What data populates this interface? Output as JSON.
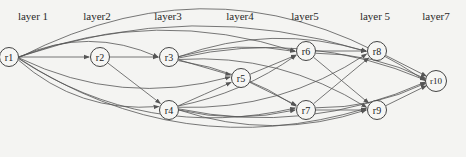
{
  "diagram": {
    "type": "layered directed graph",
    "layers": [
      {
        "label": "layer 1",
        "x": 33
      },
      {
        "label": "layer2",
        "x": 97
      },
      {
        "label": "layer3",
        "x": 168
      },
      {
        "label": "layer4",
        "x": 240
      },
      {
        "label": "layer5",
        "x": 305
      },
      {
        "label": "layer 5",
        "x": 375
      },
      {
        "label": "layer7",
        "x": 436
      }
    ],
    "nodes": [
      {
        "id": "r1",
        "label": "r1",
        "x": 9,
        "y": 57
      },
      {
        "id": "r2",
        "label": "r2",
        "x": 100,
        "y": 57
      },
      {
        "id": "r3",
        "label": "r3",
        "x": 169,
        "y": 57
      },
      {
        "id": "r4",
        "label": "r4",
        "x": 169,
        "y": 110
      },
      {
        "id": "r5",
        "label": "r5",
        "x": 241,
        "y": 78
      },
      {
        "id": "r6",
        "label": "r6",
        "x": 306,
        "y": 51
      },
      {
        "id": "r7",
        "label": "r7",
        "x": 306,
        "y": 110
      },
      {
        "id": "r8",
        "label": "r8",
        "x": 377,
        "y": 51
      },
      {
        "id": "r9",
        "label": "r9",
        "x": 377,
        "y": 110
      },
      {
        "id": "r10",
        "label": "r10",
        "x": 436,
        "y": 81
      }
    ],
    "edges": [
      [
        "r1",
        "r2"
      ],
      [
        "r1",
        "r3"
      ],
      [
        "r1",
        "r4"
      ],
      [
        "r1",
        "r5"
      ],
      [
        "r1",
        "r6"
      ],
      [
        "r1",
        "r7"
      ],
      [
        "r1",
        "r8"
      ],
      [
        "r1",
        "r9"
      ],
      [
        "r1",
        "r10"
      ],
      [
        "r2",
        "r3"
      ],
      [
        "r2",
        "r4"
      ],
      [
        "r3",
        "r5"
      ],
      [
        "r3",
        "r6"
      ],
      [
        "r3",
        "r7"
      ],
      [
        "r3",
        "r8"
      ],
      [
        "r3",
        "r9"
      ],
      [
        "r3",
        "r10"
      ],
      [
        "r4",
        "r5"
      ],
      [
        "r4",
        "r6"
      ],
      [
        "r4",
        "r7"
      ],
      [
        "r4",
        "r8"
      ],
      [
        "r4",
        "r9"
      ],
      [
        "r4",
        "r10"
      ],
      [
        "r5",
        "r6"
      ],
      [
        "r5",
        "r7"
      ],
      [
        "r6",
        "r8"
      ],
      [
        "r6",
        "r9"
      ],
      [
        "r6",
        "r10"
      ],
      [
        "r7",
        "r8"
      ],
      [
        "r7",
        "r9"
      ],
      [
        "r7",
        "r10"
      ],
      [
        "r8",
        "r10"
      ],
      [
        "r9",
        "r10"
      ]
    ],
    "colors": {
      "edge": "#555555",
      "node_border": "#444444",
      "background": "#f4f4f2"
    }
  }
}
